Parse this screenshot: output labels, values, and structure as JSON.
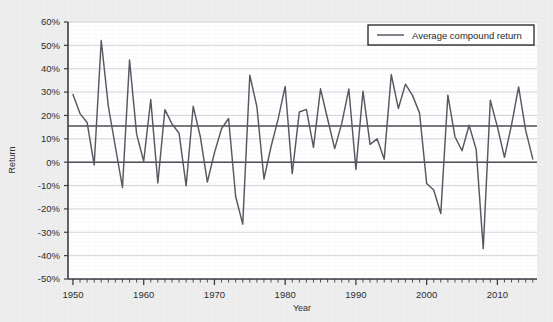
{
  "chart_data": {
    "type": "line",
    "title": "",
    "xlabel": "Year",
    "ylabel": "Return",
    "xlim": [
      1949.3,
      2015.6
    ],
    "ylim": [
      -0.5,
      0.6
    ],
    "grid": true,
    "y_tick_labels": [
      "60%",
      "50%",
      "40%",
      "30%",
      "20%",
      "10%",
      "0%",
      "-10%",
      "-20%",
      "-30%",
      "-40%",
      "-50%"
    ],
    "y_ticks": [
      0.6,
      0.5,
      0.4,
      0.3,
      0.2,
      0.1,
      0,
      -0.1,
      -0.2,
      -0.3,
      -0.4,
      -0.5
    ],
    "x_tick_labels": [
      "1950",
      "1960",
      "1970",
      "1980",
      "1990",
      "2000",
      "2010"
    ],
    "x_ticks": [
      1950,
      1960,
      1970,
      1980,
      1990,
      2000,
      2010
    ],
    "x_minor_tick_step": 1,
    "legend": {
      "position": "top-right",
      "boxed": true,
      "entries": [
        {
          "name": "Average compound return",
          "type": "hline",
          "value": 0.155,
          "color": "#4a4a52"
        }
      ]
    },
    "reference_lines": [
      {
        "name": "zero-line",
        "value": 0.0,
        "color": "#4a4a52"
      },
      {
        "name": "average-compound-return-line",
        "value": 0.155,
        "color": "#4a4a52"
      }
    ],
    "series": [
      {
        "name": "Annual return",
        "color": "#565660",
        "x": [
          1950,
          1951,
          1952,
          1953,
          1954,
          1955,
          1956,
          1957,
          1958,
          1959,
          1960,
          1961,
          1962,
          1963,
          1964,
          1965,
          1966,
          1967,
          1968,
          1969,
          1970,
          1971,
          1972,
          1973,
          1974,
          1975,
          1976,
          1977,
          1978,
          1979,
          1980,
          1981,
          1982,
          1983,
          1984,
          1985,
          1986,
          1987,
          1988,
          1989,
          1990,
          1991,
          1992,
          1993,
          1994,
          1995,
          1996,
          1997,
          1998,
          1999,
          2000,
          2001,
          2002,
          2003,
          2004,
          2005,
          2006,
          2007,
          2008,
          2009,
          2010,
          2011,
          2012,
          2013,
          2014,
          2015
        ],
        "values": [
          0.29,
          0.208,
          0.17,
          -0.012,
          0.521,
          0.24,
          0.065,
          -0.108,
          0.437,
          0.12,
          0.004,
          0.268,
          -0.089,
          0.225,
          0.164,
          0.124,
          -0.101,
          0.239,
          0.11,
          -0.085,
          0.04,
          0.143,
          0.187,
          -0.147,
          -0.265,
          0.372,
          0.238,
          -0.072,
          0.066,
          0.184,
          0.324,
          -0.049,
          0.215,
          0.226,
          0.063,
          0.314,
          0.185,
          0.058,
          0.166,
          0.313,
          -0.031,
          0.304,
          0.076,
          0.1,
          0.013,
          0.375,
          0.23,
          0.334,
          0.286,
          0.21,
          -0.091,
          -0.119,
          -0.22,
          0.287,
          0.109,
          0.049,
          0.158,
          0.055,
          -0.37,
          0.265,
          0.151,
          0.021,
          0.16,
          0.322,
          0.136,
          0.014
        ]
      }
    ]
  },
  "legend": {
    "label": "Average compound return"
  },
  "axes": {
    "y_title": "Return",
    "x_title": "Year"
  }
}
